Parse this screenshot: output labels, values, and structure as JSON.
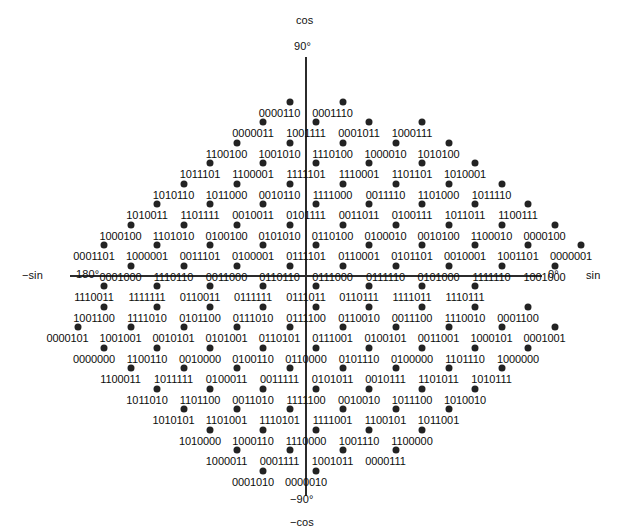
{
  "figure": {
    "type": "gray-code-encoder-diamond",
    "axes": {
      "top_label": "cos",
      "top_angle": "90°",
      "bottom_label": "−cos",
      "bottom_angle": "−90°",
      "left_label": "−sin",
      "left_angle": "180°",
      "right_label": "sin",
      "right_angle": "0°"
    },
    "colors": {
      "dot": "#232323",
      "axis": "#2b2b2b",
      "text": "#0d0d0d",
      "background": "#ffffff"
    },
    "geometry": {
      "center_x": 306,
      "center_y": 276,
      "row_step": 20.6,
      "col_step": 53,
      "half_col": 26.5
    },
    "rows": [
      {
        "y": 108,
        "offset": 0.5,
        "codes": [
          "0000110",
          "0001110"
        ]
      },
      {
        "y": 128,
        "offset": 1.0,
        "codes": [
          "0000011",
          "1001111",
          "0001011",
          "1000111"
        ]
      },
      {
        "y": 149,
        "offset": 1.5,
        "codes": [
          "1100100",
          "1001010",
          "1110100",
          "1000010",
          "1010100"
        ]
      },
      {
        "y": 169,
        "offset": 2.0,
        "codes": [
          "1011101",
          "1100001",
          "1111101",
          "1110001",
          "1101101",
          "1010001"
        ]
      },
      {
        "y": 190,
        "offset": 2.5,
        "codes": [
          "1010110",
          "1011000",
          "0010110",
          "1111000",
          "0011110",
          "1101000",
          "1011110"
        ]
      },
      {
        "y": 210,
        "offset": 3.0,
        "codes": [
          "1010011",
          "1101111",
          "0010011",
          "0101111",
          "0011011",
          "0100111",
          "1011011",
          "1100111"
        ]
      },
      {
        "y": 231,
        "offset": 3.5,
        "codes": [
          "1000100",
          "1101010",
          "0100100",
          "0101010",
          "0110100",
          "0100010",
          "0010100",
          "1100010",
          "0000100"
        ]
      },
      {
        "y": 251,
        "offset": 4.0,
        "codes": [
          "0001101",
          "1000001",
          "0011101",
          "0100001",
          "0111101",
          "0110001",
          "0101101",
          "0010001",
          "1001101",
          "0000001"
        ]
      },
      {
        "y": 272,
        "offset": 3.5,
        "codes": [
          "0001000",
          "1110110",
          "0011000",
          "0110110",
          "0111000",
          "0111110",
          "0101000",
          "1111110",
          "1001000"
        ]
      },
      {
        "y": 292,
        "offset": 4.0,
        "codes": [
          "1110011",
          "1111111",
          "0110011",
          "0111111",
          "0111011",
          "0110111",
          "1111011",
          "1110111"
        ]
      },
      {
        "y": 313,
        "offset": 4.0,
        "codes": [
          "1001100",
          "1111010",
          "0101100",
          "0111010",
          "0111100",
          "0110010",
          "0011100",
          "1110010",
          "0001100"
        ]
      },
      {
        "y": 333,
        "offset": 4.5,
        "codes": [
          "0000101",
          "1001001",
          "0010101",
          "0101001",
          "0110101",
          "0111001",
          "0100101",
          "0011001",
          "1000101",
          "0001001"
        ]
      },
      {
        "y": 354,
        "offset": 4.0,
        "codes": [
          "0000000",
          "1100110",
          "0010000",
          "0100110",
          "0110000",
          "0101110",
          "0100000",
          "1101110",
          "1000000"
        ]
      },
      {
        "y": 374,
        "offset": 3.5,
        "codes": [
          "1100011",
          "1011111",
          "0100011",
          "0011111",
          "0101011",
          "0010111",
          "1101011",
          "1010111"
        ]
      },
      {
        "y": 395,
        "offset": 3.0,
        "codes": [
          "1011010",
          "1101100",
          "0011010",
          "1111100",
          "0010010",
          "1011100",
          "1010010"
        ]
      },
      {
        "y": 415,
        "offset": 2.5,
        "codes": [
          "1010101",
          "1101001",
          "1110101",
          "1111001",
          "1100101",
          "1011001"
        ]
      },
      {
        "y": 436,
        "offset": 2.0,
        "codes": [
          "1010000",
          "1000110",
          "1110000",
          "1001110",
          "1100000"
        ]
      },
      {
        "y": 456,
        "offset": 1.5,
        "codes": [
          "1000011",
          "0001111",
          "1001011",
          "0000111"
        ]
      },
      {
        "y": 477,
        "offset": 1.0,
        "codes": [
          "0001010",
          "0000010"
        ]
      }
    ]
  }
}
